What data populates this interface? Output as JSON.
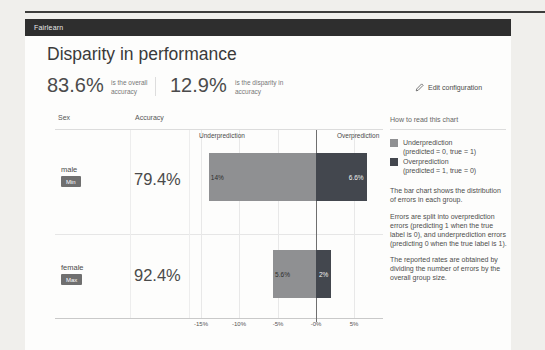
{
  "app": {
    "brand": "Fairlearn"
  },
  "header": {
    "title": "Disparity in performance",
    "metrics": [
      {
        "value": "83.6%",
        "caption": "is the overall accuracy"
      },
      {
        "value": "12.9%",
        "caption": "is the disparity in accuracy"
      }
    ],
    "edit_button": "Edit configuration"
  },
  "chart": {
    "columns": {
      "sex": "Sex",
      "accuracy": "Accuracy"
    },
    "region_labels": {
      "under": "Underprediction",
      "over": "Overprediction"
    },
    "rows": [
      {
        "group": "male",
        "badge": "Min",
        "accuracy": "79.4%",
        "under_pct": 14,
        "under_label": "14%",
        "over_pct": 6.6,
        "over_label": "6.6%"
      },
      {
        "group": "female",
        "badge": "Max",
        "accuracy": "92.4%",
        "under_pct": 5.6,
        "under_label": "5.6%",
        "over_pct": 2,
        "over_label": "2%"
      }
    ],
    "x_ticks": [
      "-15%",
      "-10%",
      "-5%",
      "-0%",
      "5%"
    ]
  },
  "help": {
    "title": "How to read this chart",
    "legend": [
      {
        "label": "Underprediction",
        "sub": "(predicted = 0, true = 1)",
        "color": "#8f9092"
      },
      {
        "label": "Overprediction",
        "sub": "(predicted = 1, true = 0)",
        "color": "#43474e"
      }
    ],
    "paragraphs": [
      "The bar chart shows the distribution of errors in each group.",
      "Errors are split into overprediction errors (predicting 1 when the true label is 0), and underprediction errors (predicting 0 when the true label is 1).",
      "The reported rates are obtained by dividing the number of errors by the overall group size."
    ]
  },
  "colors": {
    "under": "#8f9092",
    "over": "#43474e",
    "topbar": "#2e2e2e"
  },
  "chart_data": {
    "type": "bar",
    "orientation": "horizontal",
    "categories": [
      "male",
      "female"
    ],
    "series": [
      {
        "name": "Underprediction",
        "values": [
          -14,
          -5.6
        ]
      },
      {
        "name": "Overprediction",
        "values": [
          6.6,
          2
        ]
      }
    ],
    "x_tick_labels": [
      "-15%",
      "-10%",
      "-5%",
      "-0%",
      "5%"
    ],
    "xlim_pct": [
      -16.5,
      8.7
    ],
    "accuracy_by_group": {
      "male": "79.4%",
      "female": "92.4%"
    },
    "legend_position": "right-panel"
  }
}
